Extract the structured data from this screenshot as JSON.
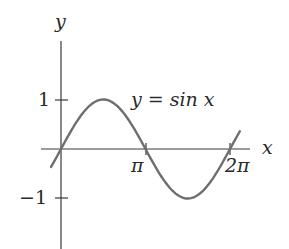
{
  "chart_data": {
    "type": "line",
    "title": "",
    "xlabel": "x",
    "ylabel": "y",
    "curve_label": "y = sin x",
    "function": "sin(x)",
    "x_ticks": [
      {
        "value": 3.14159,
        "label": "π"
      },
      {
        "value": 6.28318,
        "label": "2π"
      }
    ],
    "y_ticks": [
      {
        "value": 1,
        "label": "1"
      },
      {
        "value": -1,
        "label": "−1"
      }
    ],
    "xlim": [
      -0.74,
      7.75
    ],
    "ylim": [
      -2.0,
      2.16
    ],
    "x_domain_plotted": [
      -0.37,
      6.65
    ],
    "grid": false,
    "legend": "none",
    "series": [
      {
        "name": "y = sin x",
        "x": [
          -0.37,
          0,
          0.785,
          1.571,
          2.356,
          3.142,
          3.927,
          4.712,
          5.498,
          6.283,
          6.65
        ],
        "y": [
          -0.36,
          0,
          0.707,
          1,
          0.707,
          0,
          -0.707,
          -1,
          -0.707,
          0,
          0.36
        ]
      }
    ],
    "colors": {
      "axes": "#3a3a3a",
      "curve": "#6e6e6e",
      "text": "#2a2a2a"
    }
  },
  "labels": {
    "x_axis": "x",
    "y_axis": "y",
    "curve": "y = sin x",
    "tick_pi": "π",
    "tick_2pi": "2π",
    "tick_one": "1",
    "tick_neg_one": "−1"
  }
}
